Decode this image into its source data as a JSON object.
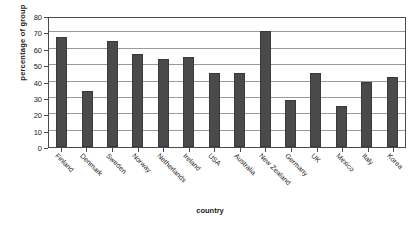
{
  "chart_data": {
    "type": "bar",
    "title": "",
    "xlabel": "country",
    "ylabel": "percentage of group",
    "categories": [
      "Finland",
      "Denmark",
      "Sweden",
      "Norway",
      "Netherlands",
      "Ireland",
      "USA",
      "Australia",
      "New Zealand",
      "Germany",
      "UK",
      "Mexico",
      "Italy",
      "Korea"
    ],
    "values": [
      67,
      34,
      65,
      57,
      54,
      55,
      45,
      45,
      71,
      29,
      45,
      25,
      40,
      43
    ],
    "ylim": [
      0,
      80
    ],
    "yticks": [
      0,
      10,
      20,
      30,
      40,
      50,
      60,
      70,
      80
    ],
    "grid": true,
    "legend": false,
    "series_color": "#4a4a4a",
    "axis_color": "#4a4a4a",
    "gridline_color": "#9a9a9a",
    "background": "#ffffff"
  }
}
